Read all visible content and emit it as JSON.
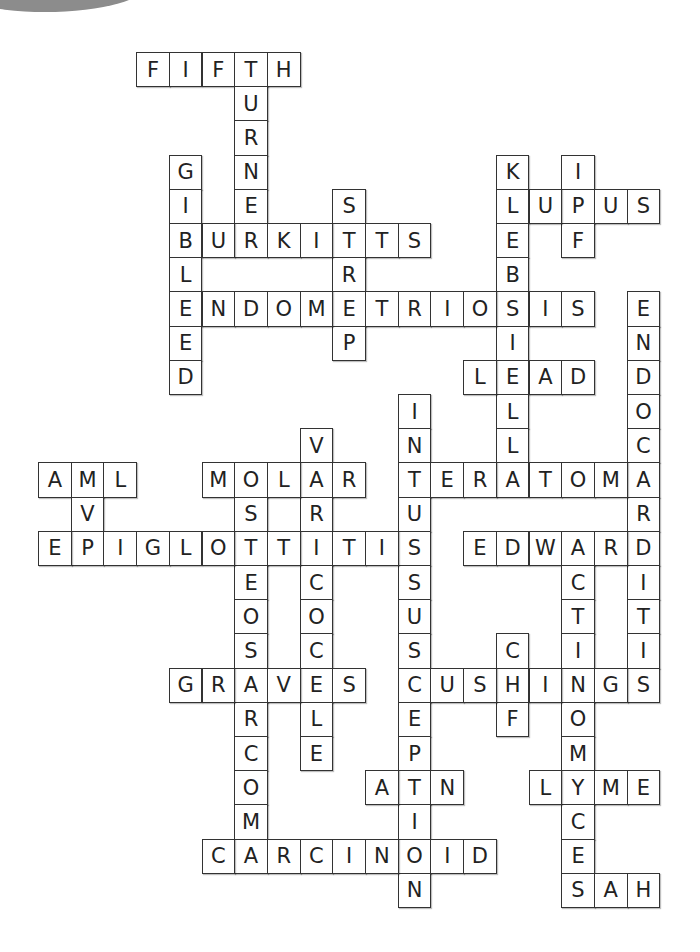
{
  "puzzle": {
    "type": "crossword-solution",
    "grid": {
      "origin_x": 38,
      "origin_y": 52,
      "cell_w": 32.7,
      "cell_h": 34.2,
      "cols": 19,
      "rows": 25
    },
    "border_color": "#333333",
    "letter_color": "#222222",
    "words": [
      {
        "word": "FIFTH",
        "dir": "across",
        "col": 3,
        "row": 0
      },
      {
        "word": "TURNER",
        "dir": "down",
        "col": 6,
        "row": 0
      },
      {
        "word": "GIBLEED",
        "dir": "down",
        "col": 4,
        "row": 3
      },
      {
        "word": "KLEBSIELLA",
        "dir": "down",
        "col": 14,
        "row": 3
      },
      {
        "word": "IPF",
        "dir": "down",
        "col": 16,
        "row": 3
      },
      {
        "word": "STREP",
        "dir": "down",
        "col": 9,
        "row": 4
      },
      {
        "word": "LUPUS",
        "dir": "across",
        "col": 14,
        "row": 4
      },
      {
        "word": "BURKITTS",
        "dir": "across",
        "col": 4,
        "row": 5
      },
      {
        "word": "ENDOMETRIOSIS",
        "dir": "across",
        "col": 4,
        "row": 7
      },
      {
        "word": "ENDOCARDITIS",
        "dir": "down",
        "col": 18,
        "row": 7
      },
      {
        "word": "LEAD",
        "dir": "across",
        "col": 13,
        "row": 9
      },
      {
        "word": "INTUSSUSCEPTION",
        "dir": "down",
        "col": 11,
        "row": 10
      },
      {
        "word": "VARICOCELE",
        "dir": "down",
        "col": 8,
        "row": 11
      },
      {
        "word": "AML",
        "dir": "across",
        "col": 0,
        "row": 12
      },
      {
        "word": "AVP",
        "dir": "down",
        "col": 1,
        "row": 12
      },
      {
        "word": "MOLAR",
        "dir": "across",
        "col": 5,
        "row": 12
      },
      {
        "word": "OSTEOSARCOMA",
        "dir": "down",
        "col": 6,
        "row": 12
      },
      {
        "word": "TERATOMA",
        "dir": "across",
        "col": 11,
        "row": 12
      },
      {
        "word": "EPIGLOTTITIS",
        "dir": "across",
        "col": 0,
        "row": 14
      },
      {
        "word": "EDWARD",
        "dir": "across",
        "col": 13,
        "row": 14
      },
      {
        "word": "ACTINOMYCES",
        "dir": "down",
        "col": 16,
        "row": 14
      },
      {
        "word": "CHF",
        "dir": "down",
        "col": 14,
        "row": 17
      },
      {
        "word": "GRAVES",
        "dir": "across",
        "col": 4,
        "row": 18
      },
      {
        "word": "CUSHINGS",
        "dir": "across",
        "col": 11,
        "row": 18
      },
      {
        "word": "ATN",
        "dir": "across",
        "col": 10,
        "row": 21
      },
      {
        "word": "LYME",
        "dir": "across",
        "col": 15,
        "row": 21
      },
      {
        "word": "CARCINOID",
        "dir": "across",
        "col": 5,
        "row": 23
      },
      {
        "word": "SAH",
        "dir": "across",
        "col": 16,
        "row": 24
      }
    ]
  }
}
